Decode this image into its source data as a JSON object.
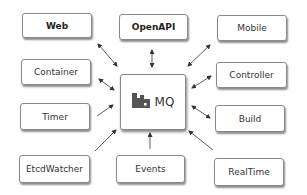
{
  "hub": {
    "label": "MQ",
    "icon": "factory-icon"
  },
  "nodes": {
    "web": "Web",
    "openapi": "OpenAPI",
    "mobile": "Mobile",
    "container": "Container",
    "controller": "Controller",
    "timer": "Timer",
    "build": "Build",
    "etcdwatcher": "EtcdWatcher",
    "events": "Events",
    "realtime": "RealTime"
  },
  "colors": {
    "border": "#8a8a8a",
    "text": "#333333",
    "icon": "#555555",
    "arrow": "#333333"
  }
}
